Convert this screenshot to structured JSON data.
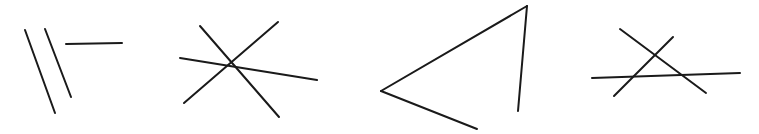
{
  "image": {
    "title": "hand-drawn line figures",
    "width": 759,
    "height": 134,
    "background_color": "#ffffff",
    "stroke_color": "#1a1a1a",
    "stroke_width": 2,
    "description": "Four separate groups of straight hand-drawn black line segments on a white background"
  },
  "groups": [
    {
      "name": "two-parallel-diagonals-and-horizontal",
      "label": "Group 1",
      "segment_count": 3,
      "segments": [
        {
          "name": "left-diagonal",
          "x1": 25,
          "y1": 30,
          "x2": 55,
          "y2": 113
        },
        {
          "name": "right-diagonal",
          "x1": 45,
          "y1": 29,
          "x2": 71,
          "y2": 97
        },
        {
          "name": "short-horizontal",
          "x1": 66,
          "y1": 44,
          "x2": 122,
          "y2": 43
        }
      ]
    },
    {
      "name": "three-line-asterisk-star",
      "label": "Group 2",
      "segment_count": 3,
      "segments": [
        {
          "name": "star-stroke-ne-sw",
          "x1": 278,
          "y1": 22,
          "x2": 184,
          "y2": 103
        },
        {
          "name": "star-stroke-nw-se",
          "x1": 200,
          "y1": 26,
          "x2": 279,
          "y2": 117
        },
        {
          "name": "star-stroke-w-e",
          "x1": 180,
          "y1": 58,
          "x2": 317,
          "y2": 80
        }
      ]
    },
    {
      "name": "open-triangle",
      "label": "Group 3",
      "segment_count": 3,
      "segments": [
        {
          "name": "triangle-upper-edge",
          "x1": 381,
          "y1": 91,
          "x2": 527,
          "y2": 6
        },
        {
          "name": "triangle-lower-edge",
          "x1": 381,
          "y1": 91,
          "x2": 477,
          "y2": 129
        },
        {
          "name": "triangle-right-edge",
          "x1": 527,
          "y1": 6,
          "x2": 518,
          "y2": 111
        }
      ]
    },
    {
      "name": "x-cross-with-horizontal",
      "label": "Group 4",
      "segment_count": 3,
      "segments": [
        {
          "name": "x-stroke-nw-se",
          "x1": 620,
          "y1": 29,
          "x2": 706,
          "y2": 93
        },
        {
          "name": "x-stroke-ne-sw",
          "x1": 673,
          "y1": 37,
          "x2": 614,
          "y2": 96
        },
        {
          "name": "long-horizontal",
          "x1": 592,
          "y1": 78,
          "x2": 740,
          "y2": 73
        }
      ]
    }
  ]
}
